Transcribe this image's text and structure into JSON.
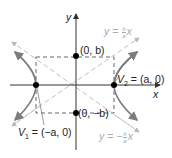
{
  "diagram": {
    "type": "hyperbola-with-asymptotes",
    "colors": {
      "axis": "#333333",
      "hyperbola": "#7d7d7d",
      "asymptote": "#b8b8b8",
      "box": "#555555",
      "point": "#000000",
      "light_label": "#aaaaaa"
    },
    "axes": {
      "x_label": "x",
      "y_label": "y"
    },
    "points": {
      "top": {
        "label": "(0, b)"
      },
      "bottom": {
        "label": "(0, −b)"
      },
      "v1": {
        "label": "V₁ = (−a, 0)",
        "name": "V",
        "sub": "1",
        "rest": " = (−a, 0)"
      },
      "v2": {
        "label": "V₂ = (a, 0)",
        "name": "V",
        "sub": "2",
        "rest": " = (a, 0)"
      }
    },
    "asymptotes": {
      "upper": {
        "label": "y = (b/a)x",
        "lhs": "y = ",
        "sign": "",
        "num": "b",
        "den": "a",
        "var": "x"
      },
      "lower": {
        "label": "y = −(b/a)x",
        "lhs": "y = ",
        "sign": "−",
        "num": "b",
        "den": "a",
        "var": "x"
      }
    }
  }
}
